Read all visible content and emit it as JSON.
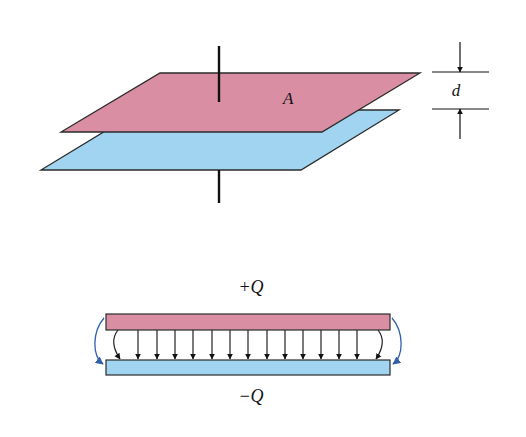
{
  "colors": {
    "positive_plate": "#d98ea4",
    "negative_plate": "#a0d4f1",
    "outline": "#2b2b2b",
    "wire": "#111111",
    "field_arrow": "#222222",
    "fringe_arrow": "#2f5fa8",
    "background": "#ffffff"
  },
  "top_diagram": {
    "area_label": "A",
    "separation_label": "d",
    "upper_plate": {
      "points": [
        [
          160,
          73
        ],
        [
          420,
          73
        ],
        [
          322,
          132
        ],
        [
          61,
          132
        ]
      ]
    },
    "lower_plate": {
      "points": [
        [
          140,
          110
        ],
        [
          399,
          110
        ],
        [
          301,
          170
        ],
        [
          41,
          170
        ]
      ]
    },
    "top_wire": {
      "x": 219,
      "y1": 46,
      "y2": 102
    },
    "bottom_wire": {
      "x": 219,
      "y1": 170,
      "y2": 203
    },
    "dimension": {
      "x": 460,
      "line_x1": 432,
      "line_x2": 489,
      "top_y": 72,
      "bottom_y": 109,
      "top_tail_y": 42,
      "bottom_tail_y": 139
    },
    "area_label_pos": {
      "x": 283,
      "y": 104
    },
    "separation_label_pos": {
      "x": 456,
      "y": 96
    }
  },
  "bottom_diagram": {
    "positive_label": "+Q",
    "negative_label": "−Q",
    "positive_label_pos": {
      "x": 251,
      "y": 293
    },
    "negative_label_pos": {
      "x": 251,
      "y": 402
    },
    "positive_plate": {
      "x": 106,
      "y": 314,
      "w": 284,
      "h": 16
    },
    "negative_plate": {
      "x": 106,
      "y": 360,
      "w": 284,
      "h": 15
    },
    "field_lines_x": [
      138,
      157,
      175,
      193,
      212,
      230,
      248,
      267,
      285,
      303,
      321,
      339,
      357
    ],
    "field_y1": 330,
    "field_y2": 360
  }
}
